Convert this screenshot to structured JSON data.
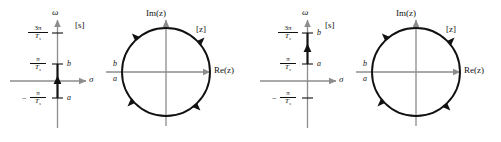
{
  "figure": {
    "colors": {
      "curve": "#111111",
      "axis_light": "#8c8c8c",
      "axis_dark": "#111111",
      "background": "#ffffff"
    }
  },
  "panels": [
    {
      "id": "panel-left",
      "splane": {
        "plane_label": "[s]",
        "vertical_axis_label": "ω",
        "horizontal_axis_label": "σ",
        "ticks": [
          {
            "id": "tick-3pi-over-Ts",
            "numerator": "3π",
            "denominator": "T",
            "denominator_sub": "s",
            "sign": "",
            "point_label": ""
          },
          {
            "id": "tick-pi-over-Ts",
            "numerator": "π",
            "denominator": "T",
            "denominator_sub": "s",
            "sign": "",
            "point_label": "b"
          },
          {
            "id": "tick-neg-pi-over-Ts",
            "numerator": "π",
            "denominator": "T",
            "denominator_sub": "s",
            "sign": "−",
            "point_label": "a"
          }
        ],
        "segment": {
          "from_label": "a",
          "to_label": "b",
          "direction": "upward"
        }
      },
      "zplane": {
        "plane_label": "[z]",
        "vertical_axis_label": "Im(z)",
        "horizontal_axis_label": "Re(z)",
        "circle_labels": {
          "upper": "b",
          "lower": "a"
        },
        "traversal": "counterclockwise",
        "arrow_count": 4
      }
    },
    {
      "id": "panel-right",
      "splane": {
        "plane_label": "[s]",
        "vertical_axis_label": "ω",
        "horizontal_axis_label": "σ",
        "ticks": [
          {
            "id": "tick-3pi-over-Ts",
            "numerator": "3π",
            "denominator": "T",
            "denominator_sub": "s",
            "sign": "",
            "point_label": "b"
          },
          {
            "id": "tick-pi-over-Ts",
            "numerator": "π",
            "denominator": "T",
            "denominator_sub": "s",
            "sign": "",
            "point_label": "a"
          },
          {
            "id": "tick-neg-pi-over-Ts",
            "numerator": "π",
            "denominator": "T",
            "denominator_sub": "s",
            "sign": "−",
            "point_label": ""
          }
        ],
        "segment": {
          "from_label": "a",
          "to_label": "b",
          "direction": "upward"
        }
      },
      "zplane": {
        "plane_label": "[z]",
        "vertical_axis_label": "Im(z)",
        "horizontal_axis_label": "Re(z)",
        "circle_labels": {
          "upper": "b",
          "lower": "a"
        },
        "traversal": "counterclockwise",
        "arrow_count": 4
      }
    }
  ]
}
